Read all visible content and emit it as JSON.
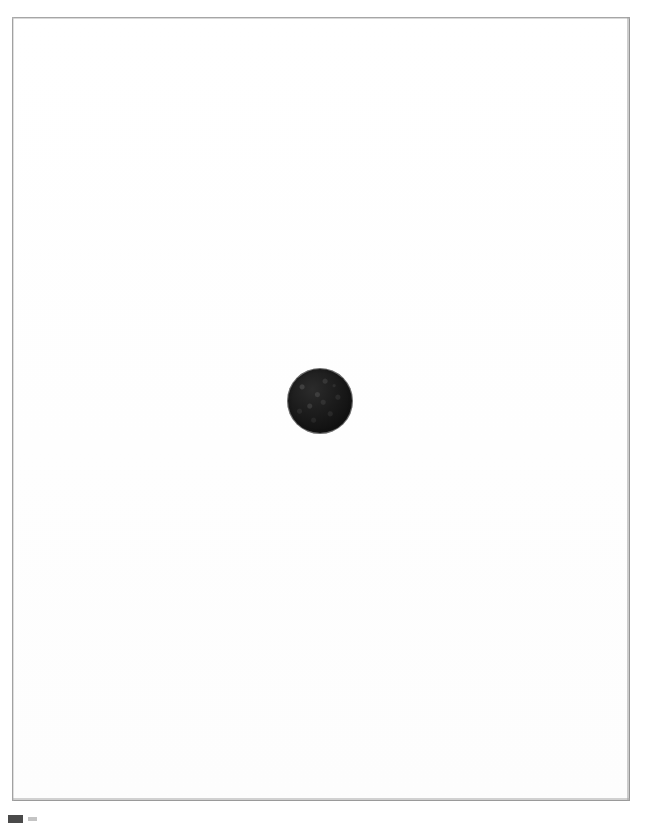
{
  "document": {
    "title": "Scanned page",
    "page_background_color": "#ffffff",
    "frame_border_color": "#8e8e8e",
    "frame": {
      "x": 12,
      "y": 17,
      "width": 618,
      "height": 784
    }
  },
  "figure": {
    "name": "dark circular blot",
    "shape": "circle",
    "color": "#1a1a1a",
    "texture": "grainy",
    "center_x": 320,
    "center_y": 401,
    "diameter": 64
  },
  "artifacts": [
    {
      "name": "scan-edge-bar",
      "color": "#4a4a4a",
      "x": 8,
      "y": 815,
      "width": 15,
      "height": 8
    },
    {
      "name": "scan-edge-smudge",
      "color": "#c4c4c4",
      "x": 28,
      "y": 817,
      "width": 9,
      "height": 4
    }
  ],
  "caption": ""
}
